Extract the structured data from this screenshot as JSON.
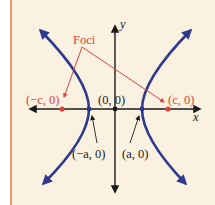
{
  "diagram": {
    "type": "hyperbola",
    "colors": {
      "background": "#fbf1e1",
      "border": "#f09a6c",
      "curve": "#2e3a8f",
      "foci": "#e0433a",
      "axis": "#1a1a1a"
    },
    "axes": {
      "x_label": "x",
      "y_label": "y"
    },
    "labels": {
      "foci": "Foci",
      "left_focus": "(−c, 0)",
      "right_focus": "(c, 0)",
      "origin": "(0, 0)",
      "left_vertex": "(−a, 0)",
      "right_vertex": "(a, 0)"
    }
  }
}
